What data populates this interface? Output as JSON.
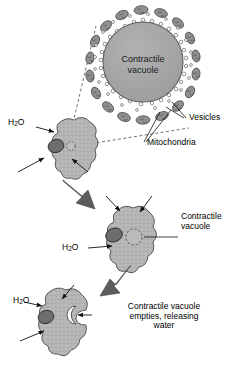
{
  "diagram": {
    "colors": {
      "cell_fill": "#b5b5b5",
      "cell_stroke": "#4a4a4a",
      "vacuole_fill": "#a8a8a8",
      "vacuole_stroke": "#5a5a5a",
      "nucleus_fill": "#6d6d6d",
      "mitochondria_fill": "#8a8a8a",
      "mitochondria_stroke": "#3a3a3a",
      "vesicle_fill": "#ffffff",
      "vesicle_stroke": "#444444",
      "arrow_fill": "#5c5c5c",
      "leader_line": "#222222",
      "background": "#ffffff"
    },
    "magnified_inset": {
      "label_line1": "Contractile",
      "label_line2": "vacuole",
      "callouts": [
        {
          "name": "vesicles",
          "text": "Vesicles"
        },
        {
          "name": "mitochondria",
          "text": "Mitochondria"
        }
      ]
    },
    "stages": [
      {
        "name": "stage-1-filling",
        "water_label": "H₂O",
        "water_label_plain": "H2O",
        "vacuole_state": "small"
      },
      {
        "name": "stage-2-enlarged",
        "water_label": "H₂O",
        "water_label_plain": "H2O",
        "vacuole_state": "enlarged",
        "callout_line1": "Contractile",
        "callout_line2": "vacuole"
      },
      {
        "name": "stage-3-emptying",
        "water_label": "H₂O",
        "water_label_plain": "H2O",
        "vacuole_state": "open-pore",
        "caption_line1": "Contractile vacuole",
        "caption_line2": "empties, releasing",
        "caption_line3": "water"
      }
    ]
  }
}
